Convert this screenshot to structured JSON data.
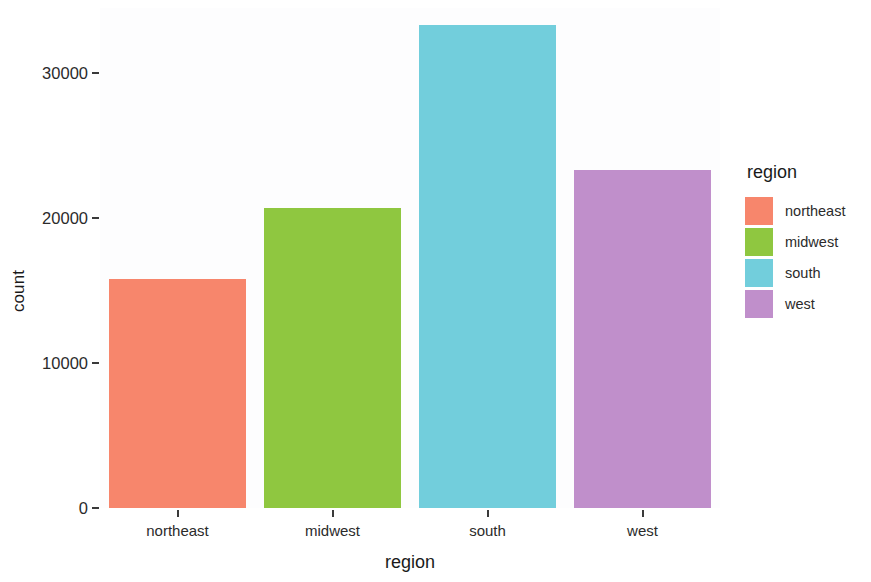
{
  "chart_data": {
    "type": "bar",
    "title": "",
    "xlabel": "region",
    "ylabel": "count",
    "categories": [
      "northeast",
      "midwest",
      "south",
      "west"
    ],
    "values": [
      15800,
      20700,
      33300,
      23350
    ],
    "colors": [
      "#F7866C",
      "#8FC740",
      "#72CEDC",
      "#C08FCB"
    ],
    "ylim": [
      0,
      34500
    ],
    "y_ticks": [
      0,
      10000,
      20000,
      30000
    ],
    "y_tick_labels": [
      "0",
      "10000",
      "20000",
      "30000"
    ],
    "grid": false,
    "legend": {
      "title": "region",
      "position": "right",
      "entries": [
        {
          "label": "northeast",
          "color": "#F7866C"
        },
        {
          "label": "midwest",
          "color": "#8FC740"
        },
        {
          "label": "south",
          "color": "#72CEDC"
        },
        {
          "label": "west",
          "color": "#C08FCB"
        }
      ]
    },
    "panel_background": "#FDFDFE",
    "plot_background": "#FFFFFF"
  }
}
